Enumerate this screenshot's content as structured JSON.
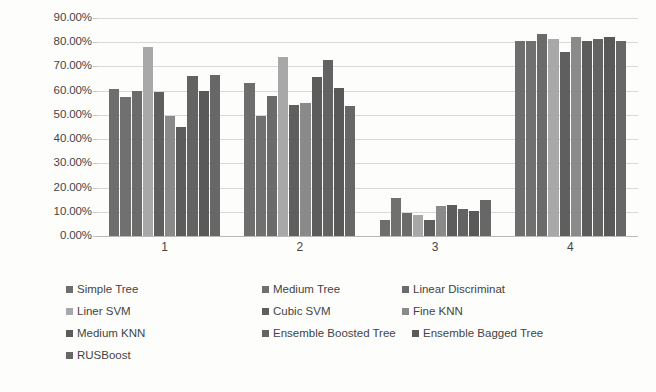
{
  "chart_data": {
    "type": "bar",
    "title": "",
    "subtitle": "",
    "xlabel": "",
    "ylabel": "",
    "categories": [
      "1",
      "2",
      "3",
      "4"
    ],
    "ylim": [
      0,
      0.9
    ],
    "y_ticks": [
      "0.00%",
      "10.00%",
      "20.00%",
      "30.00%",
      "40.00%",
      "50.00%",
      "60.00%",
      "70.00%",
      "80.00%",
      "90.00%"
    ],
    "y_tick_values": [
      0,
      10,
      20,
      30,
      40,
      50,
      60,
      70,
      80,
      90
    ],
    "grid": true,
    "legend_position": "bottom",
    "series": [
      {
        "name": "Simple Tree",
        "color": "#6e6e6e",
        "values": [
          60.5,
          63.0,
          6.5,
          80.5
        ]
      },
      {
        "name": "Medium Tree",
        "color": "#707070",
        "values": [
          57.5,
          49.5,
          15.5,
          80.5
        ]
      },
      {
        "name": "Linear Discriminat",
        "color": "#6b6b6b",
        "values": [
          60.0,
          58.0,
          9.5,
          83.5
        ]
      },
      {
        "name": "Liner SVM",
        "color": "#a8a8a8",
        "values": [
          78.0,
          74.0,
          8.5,
          81.5
        ]
      },
      {
        "name": "Cubic SVM",
        "color": "#5f5f5f",
        "values": [
          59.5,
          54.0,
          6.5,
          76.0
        ]
      },
      {
        "name": "Fine KNN",
        "color": "#8a8a8a",
        "values": [
          49.5,
          55.0,
          12.5,
          82.0
        ]
      },
      {
        "name": "Medium KNN",
        "color": "#5c5c5c",
        "values": [
          45.0,
          65.5,
          13.0,
          80.5
        ]
      },
      {
        "name": "Ensemble Boosted Tree",
        "color": "#636363",
        "values": [
          66.0,
          72.5,
          11.0,
          81.5
        ]
      },
      {
        "name": "Ensemble Bagged Tree",
        "color": "#595959",
        "values": [
          60.0,
          61.0,
          10.5,
          82.0
        ]
      },
      {
        "name": "RUSBoost",
        "color": "#676767",
        "values": [
          66.5,
          53.5,
          15.0,
          80.5
        ]
      }
    ]
  },
  "legend": {
    "rows": [
      [
        "Simple Tree",
        "Medium Tree",
        "Linear Discriminat"
      ],
      [
        "Liner SVM",
        "Cubic SVM",
        "Fine KNN"
      ],
      [
        "Medium KNN",
        "Ensemble Boosted Tree",
        "Ensemble Bagged Tree"
      ],
      [
        "RUSBoost"
      ]
    ]
  }
}
